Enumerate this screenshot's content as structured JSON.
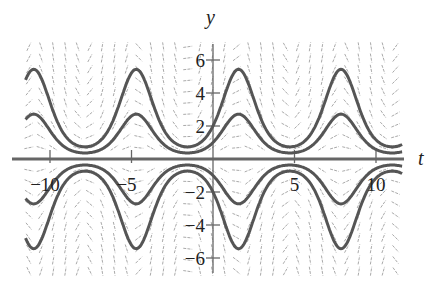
{
  "chart_data": {
    "type": "line",
    "title": "",
    "subtitle": "Slope field of dy/dt = y cos t with solution curves y = C e^{sin t}",
    "xlabel": "t",
    "ylabel": "y",
    "xlim": [
      -11.6,
      11.7
    ],
    "ylim": [
      -6.9,
      6.9
    ],
    "x_ticks": [
      -10,
      -5,
      5,
      10
    ],
    "x_tick_labels": [
      "−10",
      "−5",
      "5",
      "10"
    ],
    "y_ticks": [
      -6,
      -4,
      -2,
      2,
      4,
      6
    ],
    "y_tick_labels": [
      "−6",
      "−4",
      "−2",
      "2",
      "4",
      "6"
    ],
    "grid": false,
    "legend": null,
    "slope_field": {
      "equation": "dy/dt = y*cos(t)",
      "t_step": 0.75,
      "y_step": 0.68,
      "t_range": [
        -11.3,
        11.3
      ],
      "y_range": [
        -6.8,
        6.8
      ],
      "color": "#aaaaaa"
    },
    "series": [
      {
        "name": "C=2",
        "formula": "2*exp(sin(t))",
        "C": 2,
        "peak": 5.44,
        "min": 0.74
      },
      {
        "name": "C=1",
        "formula": "exp(sin(t))",
        "C": 1,
        "peak": 2.72,
        "min": 0.37
      },
      {
        "name": "C=-1",
        "formula": "-exp(sin(t))",
        "C": -1,
        "peak": -0.37,
        "min": -2.72
      },
      {
        "name": "C=-2",
        "formula": "-2*exp(sin(t))",
        "C": -2,
        "peak": -0.74,
        "min": -5.44
      }
    ],
    "curve_color": "#555555",
    "axis_color": "#666666"
  }
}
